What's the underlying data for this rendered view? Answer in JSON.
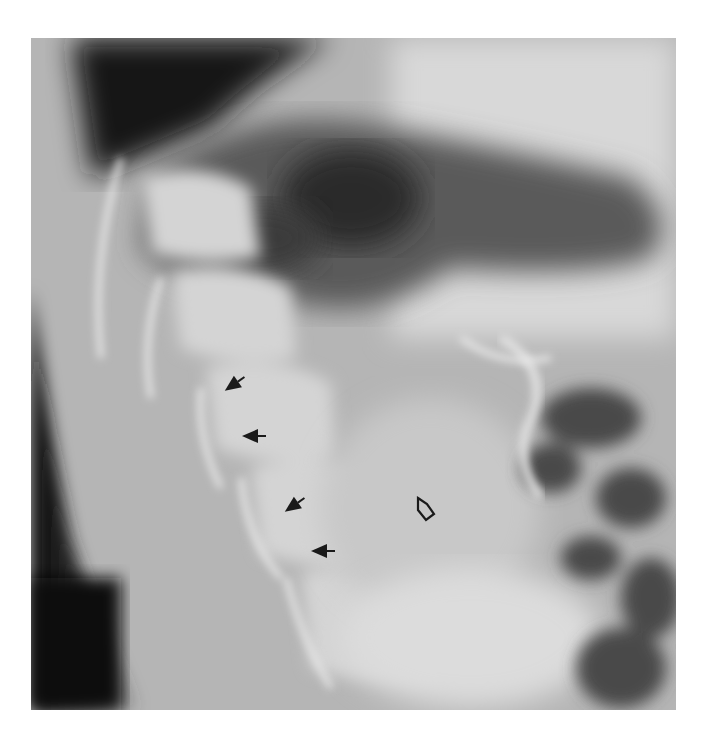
{
  "figure": {
    "type": "radiograph",
    "annotations": [
      {
        "kind": "solid-arrow",
        "x": 233,
        "y": 385,
        "direction": "down-left"
      },
      {
        "kind": "solid-arrow",
        "x": 252,
        "y": 436,
        "direction": "left"
      },
      {
        "kind": "solid-arrow",
        "x": 293,
        "y": 506,
        "direction": "down-left"
      },
      {
        "kind": "solid-arrow",
        "x": 322,
        "y": 551,
        "direction": "left"
      },
      {
        "kind": "open-arrow",
        "x": 425,
        "y": 510,
        "direction": "up"
      }
    ],
    "colors": {
      "background": "#ffffff",
      "dark": "#101010",
      "bone": "#e8e8e8",
      "arrow": "#1a1a1a"
    }
  }
}
